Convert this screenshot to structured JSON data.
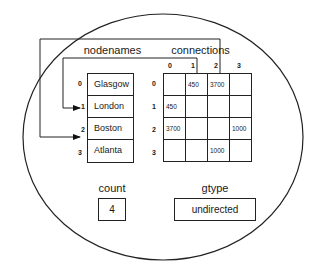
{
  "diagram": {
    "nodenames": {
      "label": "nodenames",
      "indices": [
        "0",
        "1",
        "2",
        "3"
      ],
      "items": [
        "Glasgow",
        "London",
        "Boston",
        "Atlanta"
      ]
    },
    "connections": {
      "label": "connections",
      "col_indices": [
        "0",
        "1",
        "2",
        "3"
      ],
      "row_indices": [
        "0",
        "1",
        "2",
        "3"
      ],
      "matrix": [
        [
          "",
          "450",
          "3700",
          ""
        ],
        [
          "450",
          "",
          "",
          ""
        ],
        [
          "3700",
          "",
          "",
          "1000"
        ],
        [
          "",
          "",
          "1000",
          ""
        ]
      ]
    },
    "count": {
      "label": "count",
      "value": "4"
    },
    "gtype": {
      "label": "gtype",
      "value": "undirected"
    },
    "arrows": [
      {
        "from": "connections column 1",
        "to": "nodenames index 1"
      },
      {
        "from": "connections column 2",
        "to": "nodenames index 2"
      }
    ]
  }
}
